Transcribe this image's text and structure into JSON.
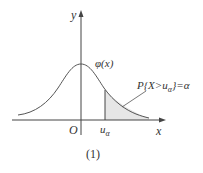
{
  "figure": {
    "y_axis_label": "y",
    "x_axis_label": "x",
    "origin_label": "O",
    "curve_label": "φ(x)",
    "tick_label": "u",
    "tick_subscript": "α",
    "area_label": "P{X>u",
    "area_label_sub": "α",
    "area_label_end": "}=α",
    "caption": "(1)",
    "colors": {
      "stroke": "#444444",
      "fill": "#e6e6e6"
    }
  }
}
